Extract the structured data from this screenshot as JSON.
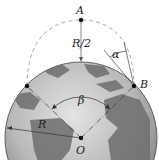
{
  "diagram": {
    "labels": {
      "point_a": "A",
      "point_b": "B",
      "center": "O",
      "height": "R/2",
      "launch_angle": "α",
      "central_angle": "β",
      "radius": "R"
    },
    "colors": {
      "globe_dark": "#5a5a5a",
      "globe_light": "#cfcfcf",
      "trajectory": "#b0b0b0",
      "lines": "#333333",
      "points": "#111111"
    },
    "geometry": {
      "center_o": [
        81,
        138
      ],
      "earth_radius_px": 76,
      "apex_a": [
        81,
        20
      ],
      "point_left": [
        27,
        86
      ],
      "point_b": [
        134,
        86
      ]
    }
  }
}
